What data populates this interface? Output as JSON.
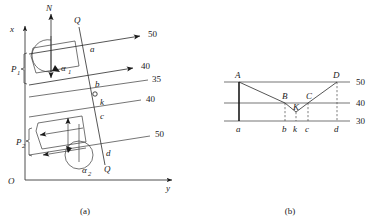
{
  "figure": {
    "panel_a": {
      "caption": "(a)",
      "axes": {
        "origin_label": "O",
        "x_axis_label": "x",
        "y_axis_label": "y"
      },
      "normal_label": "N",
      "section_line_label_top": "Q",
      "section_line_label_bottom": "Q",
      "angle_labels": [
        "α",
        "α"
      ],
      "angle_subscripts": [
        "1",
        "2"
      ],
      "force_labels": [
        "P",
        "P"
      ],
      "force_subscripts": [
        "1",
        "2"
      ],
      "contour_values": [
        "50",
        "40",
        "35",
        "40",
        "50"
      ],
      "point_labels": [
        "a",
        "b",
        "k",
        "c",
        "d"
      ]
    },
    "panel_b": {
      "caption": "(b)",
      "level_values": [
        "50",
        "40",
        "30"
      ],
      "upper_points": [
        "A",
        "B",
        "K",
        "C",
        "D"
      ],
      "lower_points": [
        "a",
        "b",
        "k",
        "c",
        "d"
      ]
    }
  },
  "colors": {
    "ink": "#1a1a1a",
    "line": "#2b2b2b",
    "dashed": "#4a4a4a",
    "background": "#ffffff"
  }
}
